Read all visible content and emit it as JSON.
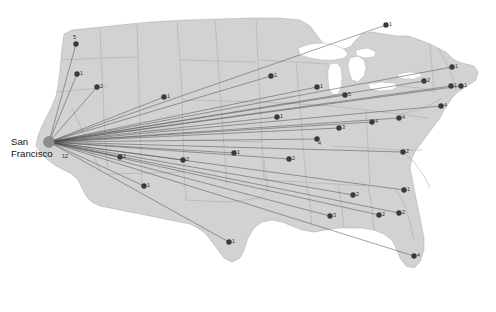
{
  "figure": {
    "type": "route-map",
    "region_name": "United States",
    "background_color": "#ffffff",
    "land_color": "#d2d2d2",
    "border_color": "#a9a9a9",
    "lake_color": "#ffffff",
    "route_color": "#4a4a4a",
    "node_color": "#3a3a3a",
    "hub_color": "#8d8d8d"
  },
  "hub": {
    "name": "San Francisco",
    "label_line1": "San",
    "label_line2": "Francisco",
    "count": "12",
    "x": 49,
    "y": 142
  },
  "nodes": [
    {
      "id": "n01",
      "label": "5",
      "x": 76,
      "y": 44,
      "lx": 73,
      "ly": 39
    },
    {
      "id": "n02",
      "label": "1",
      "x": 77,
      "y": 74,
      "lx": 80,
      "ly": 75
    },
    {
      "id": "n03",
      "label": "2",
      "x": 97,
      "y": 87,
      "lx": 100,
      "ly": 88
    },
    {
      "id": "n04",
      "label": "1",
      "x": 164,
      "y": 97,
      "lx": 167,
      "ly": 98
    },
    {
      "id": "n05",
      "label": "1",
      "x": 271,
      "y": 76,
      "lx": 274,
      "ly": 77
    },
    {
      "id": "n06",
      "label": "1",
      "x": 317,
      "y": 87,
      "lx": 320,
      "ly": 88
    },
    {
      "id": "n07",
      "label": "5",
      "x": 345,
      "y": 95,
      "lx": 348,
      "ly": 96
    },
    {
      "id": "n08",
      "label": "1",
      "x": 277,
      "y": 117,
      "lx": 280,
      "ly": 118
    },
    {
      "id": "n09",
      "label": "3",
      "x": 339,
      "y": 128,
      "lx": 342,
      "ly": 129
    },
    {
      "id": "n10",
      "label": "4",
      "x": 372,
      "y": 122,
      "lx": 375,
      "ly": 123
    },
    {
      "id": "n11",
      "label": "4",
      "x": 399,
      "y": 118,
      "lx": 402,
      "ly": 119
    },
    {
      "id": "n12",
      "label": "4",
      "x": 317,
      "y": 139,
      "lx": 318,
      "ly": 145
    },
    {
      "id": "n13",
      "label": "1",
      "x": 386,
      "y": 25,
      "lx": 389,
      "ly": 26
    },
    {
      "id": "n14",
      "label": "1",
      "x": 452,
      "y": 67,
      "lx": 455,
      "ly": 68
    },
    {
      "id": "n15",
      "label": "1",
      "x": 451,
      "y": 86,
      "lx": 454,
      "ly": 87
    },
    {
      "id": "n16",
      "label": "1",
      "x": 461,
      "y": 86,
      "lx": 464,
      "ly": 87
    },
    {
      "id": "n17",
      "label": "4",
      "x": 441,
      "y": 106,
      "lx": 444,
      "ly": 107
    },
    {
      "id": "n18",
      "label": "2",
      "x": 424,
      "y": 81,
      "lx": 427,
      "ly": 82
    },
    {
      "id": "n19",
      "label": "2",
      "x": 403,
      "y": 152,
      "lx": 406,
      "ly": 153
    },
    {
      "id": "n20",
      "label": "1",
      "x": 404,
      "y": 190,
      "lx": 407,
      "ly": 191
    },
    {
      "id": "n21",
      "label": "2",
      "x": 399,
      "y": 213,
      "lx": 402,
      "ly": 214
    },
    {
      "id": "n22",
      "label": "2",
      "x": 379,
      "y": 215,
      "lx": 382,
      "ly": 216
    },
    {
      "id": "n23",
      "label": "3",
      "x": 330,
      "y": 216,
      "lx": 333,
      "ly": 217
    },
    {
      "id": "n24",
      "label": "2",
      "x": 353,
      "y": 195,
      "lx": 356,
      "ly": 196
    },
    {
      "id": "n25",
      "label": "4",
      "x": 414,
      "y": 256,
      "lx": 417,
      "ly": 257
    },
    {
      "id": "n26",
      "label": "2",
      "x": 289,
      "y": 159,
      "lx": 292,
      "ly": 160
    },
    {
      "id": "n27",
      "label": "1",
      "x": 234,
      "y": 153,
      "lx": 237,
      "ly": 154
    },
    {
      "id": "n28",
      "label": "2",
      "x": 183,
      "y": 160,
      "lx": 186,
      "ly": 161
    },
    {
      "id": "n29",
      "label": "2",
      "x": 120,
      "y": 157,
      "lx": 123,
      "ly": 158
    },
    {
      "id": "n30",
      "label": "1",
      "x": 144,
      "y": 186,
      "lx": 147,
      "ly": 187
    },
    {
      "id": "n31",
      "label": "1",
      "x": 229,
      "y": 242,
      "lx": 232,
      "ly": 243
    }
  ]
}
